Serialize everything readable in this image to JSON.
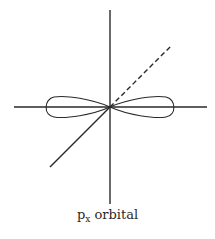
{
  "diagram": {
    "caption": {
      "main": "p",
      "subscript": "x",
      "suffix": " orbital"
    },
    "stroke_color": "#2a2a2a",
    "background": "#ffffff",
    "axes": {
      "origin": [
        110,
        107
      ],
      "vertical": {
        "x": 110,
        "y1": 10,
        "y2": 204
      },
      "horizontal": {
        "y": 107,
        "x1": 14,
        "x2": 207
      },
      "diagonal_solid": {
        "x1": 110,
        "y1": 107,
        "x2": 50,
        "y2": 167
      },
      "diagonal_dashed": {
        "x1": 110,
        "y1": 107,
        "x2": 171,
        "y2": 46
      }
    },
    "lobes": [
      {
        "name": "left-lobe",
        "tip_x": 45,
        "half_height": 10
      },
      {
        "name": "right-lobe",
        "tip_x": 174,
        "half_height": 10
      }
    ]
  }
}
